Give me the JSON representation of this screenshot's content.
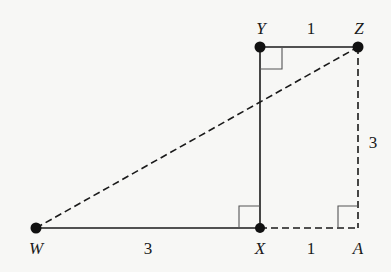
{
  "diagram": {
    "points": {
      "W": {
        "label": "W"
      },
      "X": {
        "label": "X"
      },
      "Y": {
        "label": "Y"
      },
      "Z": {
        "label": "Z"
      },
      "A": {
        "label": "A"
      }
    },
    "lengths": {
      "YZ": "1",
      "ZA": "3",
      "WX": "3",
      "XA": "1"
    },
    "colors": {
      "line": "#1a1a1a",
      "background": "#f7f7f5"
    }
  }
}
